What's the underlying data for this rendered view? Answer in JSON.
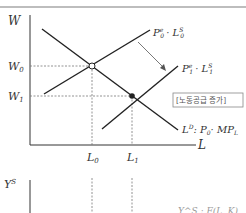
{
  "diagram": {
    "top_panel": {
      "y_axis_label": "W",
      "x_axis_label": "L",
      "wage_levels": [
        {
          "label": "W",
          "sub": "0"
        },
        {
          "label": "W",
          "sub": "1"
        }
      ],
      "labor_levels": [
        {
          "label": "L",
          "sub": "0"
        },
        {
          "label": "L",
          "sub": "1"
        }
      ],
      "curves": {
        "supply_initial": {
          "label_main": "P",
          "label_sup": "e",
          "label_sub": "0",
          "label_rest": "· L",
          "rest_sup": "S",
          "rest_sub": "0"
        },
        "supply_shifted": {
          "label_main": "P",
          "label_sup": "e",
          "label_sub": "1",
          "label_rest": "· L",
          "rest_sup": "S",
          "rest_sub": "1"
        },
        "demand": {
          "label_main": "L",
          "label_sup": "D",
          "label_rest": ": P",
          "rest_sub": "0",
          "label_tail": "· MP",
          "tail_sub": "L"
        }
      },
      "annotation_box": "[노동공급 증가]",
      "equilibria": [
        {
          "name": "initial",
          "style": "open"
        },
        {
          "name": "new",
          "style": "filled"
        }
      ]
    },
    "bottom_panel": {
      "y_axis_label": "Y",
      "y_axis_sup": "S",
      "partial_label": "Y^S : F(L, K)"
    },
    "colors": {
      "line": "#222222",
      "dashed": "#777777",
      "topline": "#bdbdbd",
      "box_border": "#888888"
    }
  }
}
